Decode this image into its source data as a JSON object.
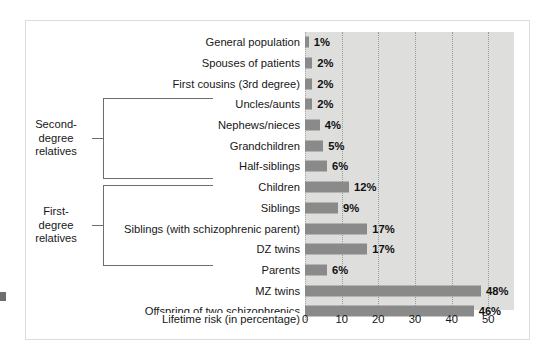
{
  "chart_data": {
    "type": "bar",
    "orientation": "horizontal",
    "title": "",
    "xlabel": "Lifetime risk (in percentage)",
    "ylabel": "",
    "xlim": [
      0,
      57
    ],
    "xticks": [
      0,
      10,
      20,
      30,
      40,
      50
    ],
    "grid": true,
    "legend": null,
    "unit": "%",
    "bar_color": "#8a8a8a",
    "panel_color": "#dededd",
    "categories": [
      "General population",
      "Spouses of patients",
      "First cousins (3rd degree)",
      "Uncles/aunts",
      "Nephews/nieces",
      "Grandchildren",
      "Half-siblings",
      "Children",
      "Siblings",
      "Siblings (with schizophrenic parent)",
      "DZ twins",
      "Parents",
      "MZ twins",
      "Offspring of two schizophrenics"
    ],
    "values": [
      1,
      2,
      2,
      2,
      4,
      5,
      6,
      12,
      9,
      17,
      17,
      6,
      48,
      46
    ],
    "value_labels": [
      "1%",
      "2%",
      "2%",
      "2%",
      "4%",
      "5%",
      "6%",
      "12%",
      "9%",
      "17%",
      "17%",
      "6%",
      "48%",
      "46%"
    ],
    "annotations": [
      {
        "label": "Second-degree relatives",
        "label_lines": [
          "Second-",
          "degree",
          "relatives"
        ],
        "covers": [
          "Uncles/aunts",
          "Nephews/nieces",
          "Grandchildren",
          "Half-siblings"
        ]
      },
      {
        "label": "First-degree relatives",
        "label_lines": [
          "First-",
          "degree",
          "relatives"
        ],
        "covers": [
          "Children",
          "Siblings",
          "Siblings (with schizophrenic parent)",
          "DZ twins",
          "Parents"
        ]
      }
    ]
  },
  "axis": {
    "tick_labels": [
      "0",
      "10",
      "20",
      "30",
      "40",
      "50"
    ],
    "title": "Lifetime risk (in percentage)"
  },
  "groups": {
    "second": {
      "line1": "Second-",
      "line2": "degree",
      "line3": "relatives"
    },
    "first": {
      "line1": "First-",
      "line2": "degree",
      "line3": "relatives"
    }
  },
  "rows": [
    {
      "label": "General population",
      "value_label": "1%"
    },
    {
      "label": "Spouses of patients",
      "value_label": "2%"
    },
    {
      "label": "First cousins (3rd degree)",
      "value_label": "2%"
    },
    {
      "label": "Uncles/aunts",
      "value_label": "2%"
    },
    {
      "label": "Nephews/nieces",
      "value_label": "4%"
    },
    {
      "label": "Grandchildren",
      "value_label": "5%"
    },
    {
      "label": "Half-siblings",
      "value_label": "6%"
    },
    {
      "label": "Children",
      "value_label": "12%"
    },
    {
      "label": "Siblings",
      "value_label": "9%"
    },
    {
      "label": "Siblings (with schizophrenic parent)",
      "value_label": "17%"
    },
    {
      "label": "DZ twins",
      "value_label": "17%"
    },
    {
      "label": "Parents",
      "value_label": "6%"
    },
    {
      "label": "MZ twins",
      "value_label": "48%"
    },
    {
      "label": "Offspring of two schizophrenics",
      "value_label": "46%"
    }
  ]
}
